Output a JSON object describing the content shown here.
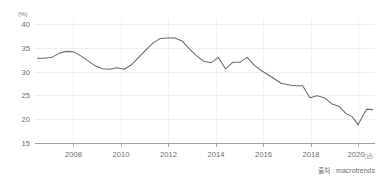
{
  "chart_data": {
    "type": "line",
    "title": "",
    "subtitle": "",
    "xlabel": "(년)",
    "ylabel": "(%)",
    "unit_label": "(%)",
    "xlim": [
      2006.6,
      2020.7
    ],
    "ylim": [
      15,
      40
    ],
    "grid": true,
    "legend": null,
    "legend_position": "none",
    "y_ticks": [
      40,
      35,
      30,
      25,
      20,
      15
    ],
    "y_tick_labels": [
      "40",
      "35",
      "30",
      "25",
      "20",
      "15"
    ],
    "x_ticks": [
      2008,
      2010,
      2012,
      2014,
      2016,
      2018,
      2020
    ],
    "x_tick_labels": [
      "2008",
      "2010",
      "2012",
      "2014",
      "2016",
      "2018",
      "2020"
    ],
    "x_axis_suffix": "(년)",
    "series": [
      {
        "name": "value",
        "color": "#6b6b6b",
        "x": [
          2006.7,
          2007.0,
          2007.3,
          2007.6,
          2007.9,
          2008.2,
          2008.5,
          2008.8,
          2009.1,
          2009.4,
          2009.7,
          2010.0,
          2010.3,
          2010.6,
          2010.9,
          2011.2,
          2011.5,
          2011.8,
          2012.1,
          2012.4,
          2012.7,
          2013.0,
          2013.3,
          2013.6,
          2013.9,
          2014.2,
          2014.5,
          2014.8,
          2015.1,
          2015.4,
          2015.7,
          2016.0,
          2016.4,
          2016.8,
          2017.2,
          2017.45,
          2017.7,
          2018.0,
          2018.3,
          2018.6,
          2018.9,
          2019.2,
          2019.5,
          2019.75,
          2020.0,
          2020.35,
          2020.6
        ],
        "y": [
          32.1,
          32.1,
          32.3,
          33.1,
          33.5,
          33.4,
          32.6,
          31.6,
          30.6,
          30.0,
          29.9,
          30.2,
          29.9,
          30.8,
          32.3,
          33.8,
          35.2,
          36.1,
          36.2,
          36.2,
          35.6,
          34.0,
          32.6,
          31.5,
          31.2,
          32.3,
          30.0,
          31.3,
          31.3,
          32.3,
          30.7,
          29.6,
          28.4,
          27.1,
          26.7,
          26.6,
          26.6,
          24.2,
          24.6,
          24.2,
          23.0,
          22.5,
          21.0,
          20.4,
          18.8,
          21.9,
          21.8
        ]
      }
    ],
    "annotations": []
  },
  "source": {
    "prefix": "출처 : ",
    "name": "macrotrends",
    "full": "출처 : macrotrends"
  },
  "colors": {
    "line": "#6b6b6b",
    "grid": "#e8e8e8",
    "axis": "#9a9a9a",
    "text": "#6e6e6e",
    "background": "#ffffff"
  }
}
